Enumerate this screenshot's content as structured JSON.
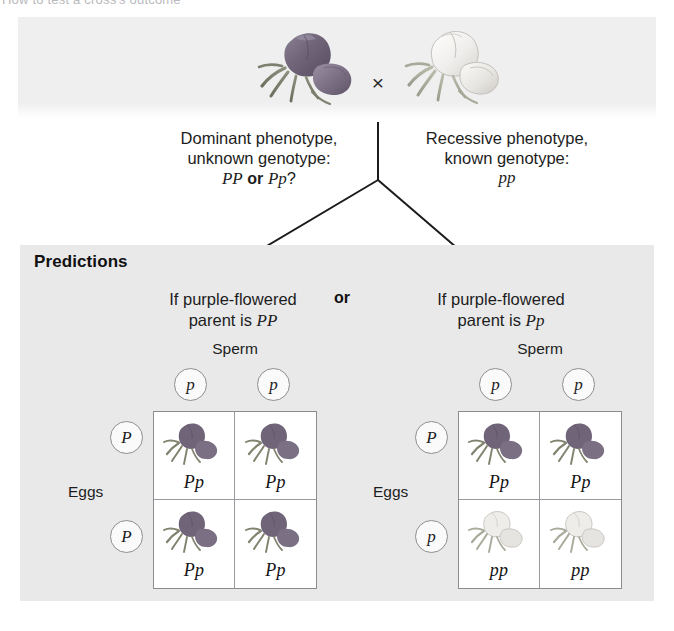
{
  "figure": {
    "cropped_top_text": "How to test a cross's outcome",
    "cross_symbol": "×"
  },
  "parents": {
    "left": {
      "line1": "Dominant phenotype,",
      "line2": "unknown genotype:",
      "genotype_a": "PP",
      "connector": "or",
      "genotype_b": "Pp",
      "question_mark": "?",
      "flower_color": "#6b5f7a",
      "flower_name": "purple-flower-illustration"
    },
    "right": {
      "line1": "Recessive phenotype,",
      "line2": "known genotype:",
      "genotype": "pp",
      "flower_color": "#e8e6e4",
      "flower_name": "white-flower-illustration"
    }
  },
  "predictions": {
    "title": "Predictions",
    "or_label": "or",
    "panels": [
      {
        "head_line1": "If purple-flowered",
        "head_line2_prefix": "parent is",
        "head_genotype": "PP",
        "sperm_label": "Sperm",
        "eggs_label": "Eggs",
        "sperm_gametes": [
          "p",
          "p"
        ],
        "egg_gametes": [
          "P",
          "P"
        ],
        "cells": [
          {
            "genotype": "Pp",
            "phenotype": "purple"
          },
          {
            "genotype": "Pp",
            "phenotype": "purple"
          },
          {
            "genotype": "Pp",
            "phenotype": "purple"
          },
          {
            "genotype": "Pp",
            "phenotype": "purple"
          }
        ]
      },
      {
        "head_line1": "If purple-flowered",
        "head_line2_prefix": "parent is",
        "head_genotype": "Pp",
        "sperm_label": "Sperm",
        "eggs_label": "Eggs",
        "sperm_gametes": [
          "p",
          "p"
        ],
        "egg_gametes": [
          "P",
          "p"
        ],
        "cells": [
          {
            "genotype": "Pp",
            "phenotype": "purple"
          },
          {
            "genotype": "Pp",
            "phenotype": "purple"
          },
          {
            "genotype": "pp",
            "phenotype": "white"
          },
          {
            "genotype": "pp",
            "phenotype": "white"
          }
        ]
      }
    ]
  },
  "colors": {
    "band_background": "#efeff0",
    "panel_background": "#e9e9ea",
    "cell_background": "#ffffff",
    "line": "#8c8c90",
    "text": "#1d1d1d",
    "purple_flower": "#6b5f7a",
    "white_flower": "#e8e6e4"
  }
}
